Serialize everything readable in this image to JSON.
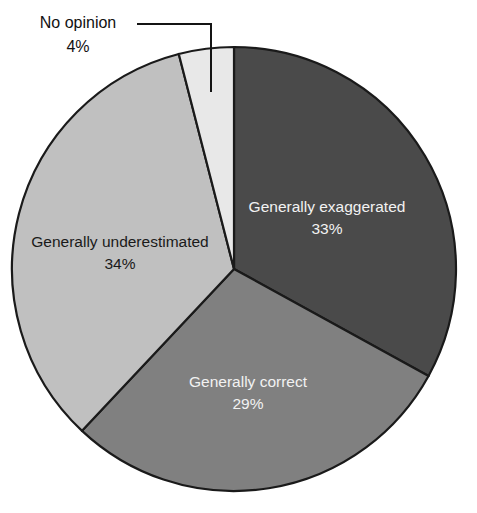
{
  "chart_data": {
    "type": "pie",
    "title": "",
    "subtitle": "",
    "xlabel": "",
    "ylabel": "",
    "legend_position": "none",
    "grid": false,
    "labels_inside": true,
    "start_angle_deg": 0,
    "direction": "clockwise",
    "categories": [
      "Generally exaggerated",
      "Generally correct",
      "Generally underestimated",
      "No opinion"
    ],
    "values": [
      33,
      29,
      34,
      4
    ],
    "value_suffix": "%",
    "colors": [
      "#4a4a4a",
      "#808080",
      "#c0c0c0",
      "#e8e8e8"
    ],
    "slices": [
      {
        "label": "Generally exaggerated",
        "value": 33,
        "value_text": "33%",
        "color": "#4a4a4a",
        "label_color": "#f2f2f2",
        "label_placement": "inside",
        "text_class": "on-dark",
        "label_x": 327,
        "label_y": 208,
        "value_x": 327,
        "value_y": 230
      },
      {
        "label": "Generally correct",
        "value": 29,
        "value_text": "29%",
        "color": "#808080",
        "label_color": "#f2f2f2",
        "label_placement": "inside",
        "text_class": "on-dark",
        "label_x": 248,
        "label_y": 383,
        "value_x": 248,
        "value_y": 405
      },
      {
        "label": "Generally underestimated",
        "value": 34,
        "value_text": "34%",
        "color": "#c0c0c0",
        "label_color": "#1a1a1a",
        "label_placement": "inside",
        "text_class": "on-light",
        "label_x": 120,
        "label_y": 243,
        "value_x": 120,
        "value_y": 265
      },
      {
        "label": "No opinion",
        "value": 4,
        "value_text": "4%",
        "color": "#e8e8e8",
        "label_color": "#111111",
        "label_placement": "callout",
        "label_x": 78,
        "label_y": 28,
        "value_x": 78,
        "value_y": 52
      }
    ]
  },
  "geometry": {
    "center_x": 234,
    "center_y": 269,
    "radius": 222,
    "stroke_color": "#1a1a1a",
    "stroke_width": 2.2
  },
  "callout": {
    "leader_points": "137,24 211,24 211,92",
    "label": "No opinion",
    "value_text": "4%"
  },
  "canvas": {
    "width": 477,
    "height": 513,
    "background": "#ffffff"
  }
}
